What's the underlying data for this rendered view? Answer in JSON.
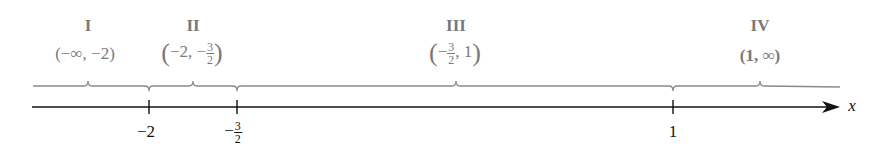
{
  "axis": {
    "variable": "x",
    "color": "#111111"
  },
  "brace_color": "#8a8a8a",
  "label_color": "#7a7a7a",
  "ticks": [
    {
      "value": -2,
      "label": "−2"
    },
    {
      "value": -1.5,
      "label_sign": "−",
      "label_num": "3",
      "label_den": "2"
    },
    {
      "value": 1,
      "label": "1"
    }
  ],
  "regions": [
    {
      "id": "I",
      "interval": "(−∞, −2)"
    },
    {
      "id": "II",
      "interval_left": "−2, −",
      "interval_num": "3",
      "interval_den": "2"
    },
    {
      "id": "III",
      "interval_sign": "−",
      "interval_num": "3",
      "interval_den": "2",
      "interval_right": ", 1"
    },
    {
      "id": "IV",
      "interval": "(1, ∞)"
    }
  ]
}
